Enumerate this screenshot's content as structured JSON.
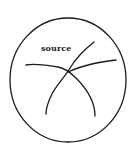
{
  "diagram": {
    "label": "source",
    "stroke_color": "#1a1a1a",
    "background": "#ffffff",
    "boundary": {
      "shape": "ellipse",
      "cx": 68,
      "cy": 80,
      "rx": 58,
      "ry": 62
    },
    "curves": [
      {
        "id": "curve-left-to-bottom-right",
        "path": "M26,65 C38,63 50,66 58,67 C64,68 70,72 76,78 C86,88 95,100 95,116"
      },
      {
        "id": "curve-top-right-to-bottom-left",
        "path": "M94,42 C84,50 76,58 70,68 C64,78 56,86 52,94 C48,102 46,108 46,114"
      },
      {
        "id": "curve-center-to-right",
        "path": "M68,72 C76,68 84,66 92,64 C100,62 108,61 116,60"
      }
    ]
  }
}
